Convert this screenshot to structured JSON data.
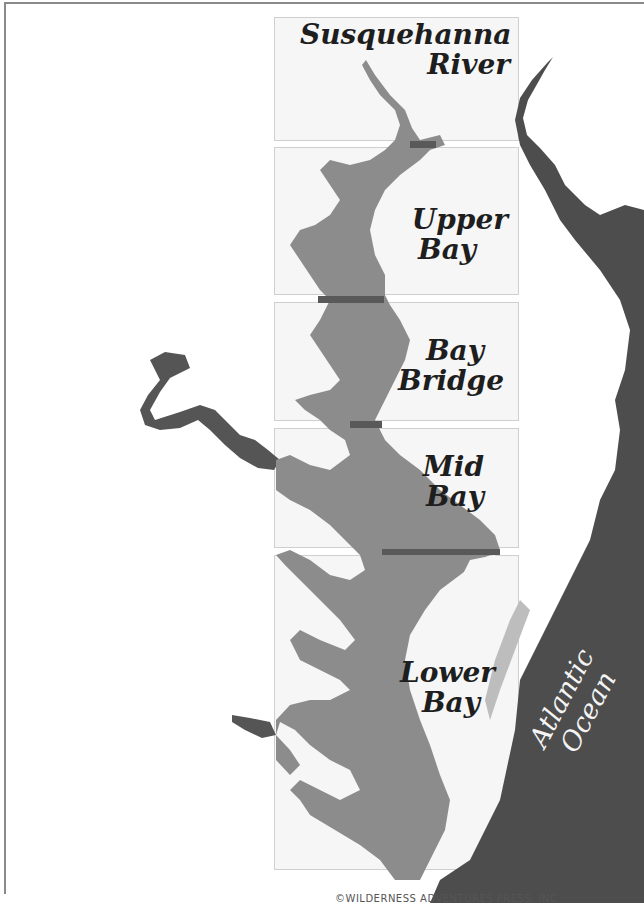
{
  "map": {
    "title": "Chesapeake Bay Regions",
    "colors": {
      "land": "#ffffff",
      "bay_water": "#8c8c8c",
      "ocean_and_outside_water": "#4d4d4d",
      "panel_fill": "#eeeeee",
      "divider": "#595959",
      "frame": "#8a8a8a"
    },
    "regions": [
      {
        "id": "susquehanna-river",
        "line1": "Susquehanna",
        "line2": "River"
      },
      {
        "id": "upper-bay",
        "line1": "Upper",
        "line2": "Bay"
      },
      {
        "id": "bay-bridge",
        "line1": "Bay",
        "line2": "Bridge"
      },
      {
        "id": "mid-bay",
        "line1": "Mid",
        "line2": "Bay"
      },
      {
        "id": "lower-bay",
        "line1": "Lower",
        "line2": "Bay"
      }
    ],
    "ocean_label": {
      "line1": "Atlantic",
      "line2": "Ocean"
    },
    "copyright": "©WILDERNESS ADVENTURES PRESS, INC"
  }
}
